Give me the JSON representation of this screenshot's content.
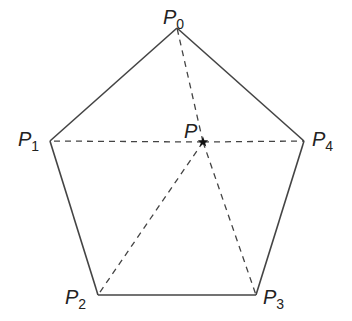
{
  "figure": {
    "type": "regular-pentagon-with-interior-point",
    "vertices": [
      {
        "id": "P0",
        "letter": "P",
        "subscript": "0"
      },
      {
        "id": "P1",
        "letter": "P",
        "subscript": "1"
      },
      {
        "id": "P2",
        "letter": "P",
        "subscript": "2"
      },
      {
        "id": "P3",
        "letter": "P",
        "subscript": "3"
      },
      {
        "id": "P4",
        "letter": "P",
        "subscript": "4"
      }
    ],
    "interior_point": {
      "id": "P",
      "letter": "P",
      "marker": "star"
    },
    "edges": [
      [
        "P0",
        "P1"
      ],
      [
        "P1",
        "P2"
      ],
      [
        "P2",
        "P3"
      ],
      [
        "P3",
        "P4"
      ],
      [
        "P4",
        "P0"
      ]
    ],
    "dashed_segments": [
      [
        "P",
        "P0"
      ],
      [
        "P",
        "P1"
      ],
      [
        "P",
        "P2"
      ],
      [
        "P",
        "P3"
      ],
      [
        "P",
        "P4"
      ]
    ],
    "colors": {
      "line": "#444444",
      "text": "#222222"
    }
  }
}
